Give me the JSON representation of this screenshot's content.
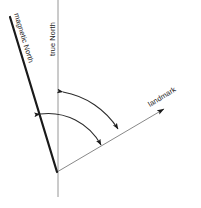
{
  "figure": {
    "type": "compass-declination-diagram",
    "background_color": "#ffffff",
    "width": 201,
    "height": 208
  },
  "labels": {
    "magnetic_north": "magnetic North",
    "true_north": "true North",
    "landmark": "landmark",
    "caption": ""
  },
  "colors": {
    "magnetic_north_line": "#1a1a1a",
    "true_north_line": "#8a8a8a",
    "landmark_line": "#7a7a7a",
    "arc": "#2b2b2b",
    "arrowhead": "#1a1a1a",
    "text": "#1a1a1a"
  },
  "geometry": {
    "vertex": {
      "x": 57,
      "y": 172
    },
    "magnetic_north_tip": {
      "x": 10,
      "y": 17
    },
    "true_north_top": {
      "x": 58,
      "y": 0
    },
    "true_north_bottom": {
      "x": 58,
      "y": 197
    },
    "landmark_tip": {
      "x": 169,
      "y": 106
    },
    "magnetic_north_line_width": 2.1,
    "true_north_line_width": 0.8,
    "landmark_line_width": 0.8,
    "arc_line_width": 1.0
  },
  "arcs": [
    {
      "name": "declination-arc-true-to-landmark",
      "from": "true North",
      "to": "landmark",
      "start": {
        "x": 60,
        "y": 92
      },
      "end": {
        "x": 121,
        "y": 131
      },
      "arrowheads": "both-ends"
    },
    {
      "name": "bearing-arc-magnetic-to-landmark",
      "from": "magnetic North",
      "to": "landmark",
      "start": {
        "x": 36,
        "y": 115
      },
      "end": {
        "x": 104,
        "y": 146
      },
      "arrowheads": "both-ends"
    }
  ],
  "label_rotations": {
    "magnetic_north_deg": 73,
    "true_north_deg": -90,
    "landmark_deg": -32
  }
}
